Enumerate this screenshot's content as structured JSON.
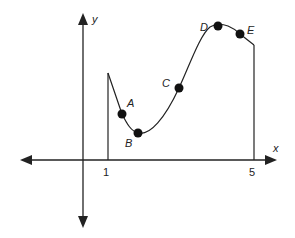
{
  "diagram": {
    "axes": {
      "x_label": "x",
      "y_label": "y",
      "tick_labels": [
        "1",
        "5"
      ]
    },
    "points": [
      {
        "label": "A"
      },
      {
        "label": "B"
      },
      {
        "label": "C"
      },
      {
        "label": "D"
      },
      {
        "label": "E"
      }
    ],
    "colors": {
      "stroke": "#222222",
      "background": "#ffffff"
    }
  }
}
